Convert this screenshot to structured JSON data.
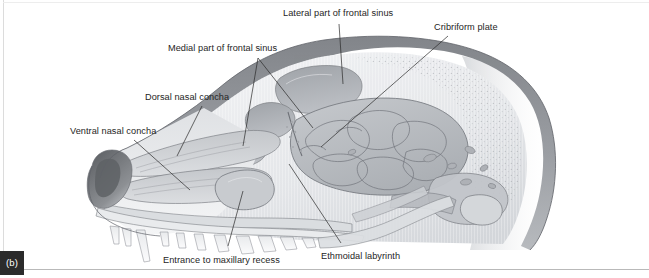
{
  "figure": {
    "panel_letter": "(b)",
    "orientation": "Rostral to the left, caudal to the right",
    "style": "grayscale medical illustration with leader-line annotations"
  },
  "labels": {
    "lateral_frontal_sinus": "Lateral part of frontal sinus",
    "cribriform_plate": "Cribriform plate",
    "medial_frontal_sinus": "Medial part of frontal sinus",
    "dorsal_nasal_concha": "Dorsal nasal concha",
    "ventral_nasal_concha": "Ventral nasal concha",
    "entrance_maxillary_recess": "Entrance to maxillary recess",
    "ethmoidal_labyrinth": "Ethmoidal labyrinth"
  },
  "colors": {
    "background": "#ffffff",
    "label_text": "#252525",
    "leader_line": "#2a2a2a",
    "badge_background": "#2b2b2b",
    "badge_text": "#ffffff",
    "caption_rule": "#b9b9b9",
    "outer_bone_dark": "#8e9094",
    "outer_bone_mid": "#a9abaf",
    "cancellous_light": "#eceef0",
    "sinus_fill": "#adb1b6",
    "concha_fill": "#c9ccd0",
    "ethmoid_fill": "#bfc3c8",
    "outline_stroke": "#6e7176",
    "tooth_fill": "#e4e6e8",
    "nostril_dark": "#6b6d71"
  },
  "structures": [
    "Lateral part of frontal sinus",
    "Medial part of frontal sinus",
    "Cribriform plate",
    "Dorsal nasal concha",
    "Ventral nasal concha",
    "Ethmoidal labyrinth",
    "Entrance to maxillary recess",
    "Nasal vestibule",
    "Hard palate",
    "Mandibular teeth",
    "Maxillary teeth",
    "Cranial cavity",
    "Tympanic bulla"
  ]
}
